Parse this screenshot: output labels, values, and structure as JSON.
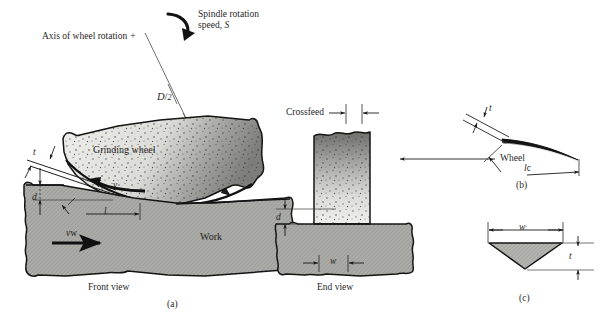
{
  "figure": {
    "title_visible": false,
    "background_color": "#ffffff",
    "ink_color": "#1a1a1a"
  },
  "panel_a": {
    "caption": "(a)",
    "view_label": "Front view",
    "axis_label": "Axis of wheel rotation",
    "axis_marker": "+",
    "spindle_label_line1": "Spindle rotation",
    "spindle_label_line2": "speed, S",
    "spindle_speed_symbol": "S",
    "radius_label_numerator": "D",
    "radius_label_denominator": "2",
    "radius_label": "D/2",
    "wheel_label": "Grinding wheel",
    "work_label": "Work",
    "chip_thickness_label": "t",
    "depth_label": "d",
    "contact_length_label": "l",
    "wheel_speed_label": "v",
    "work_speed_label": "v",
    "work_speed_subscript": "w",
    "wheel_fill_light": "#e8e8e4",
    "wheel_fill_dark": "#8e8e8a",
    "work_fill": "#a9a9a5"
  },
  "panel_b": {
    "caption": "(b)",
    "view_label": "End view",
    "crossfeed_label": "Crossfeed",
    "wheel_label": "Wheel",
    "depth_label": "d",
    "width_label": "w",
    "wheel_fill_top": "#6e6e6a",
    "wheel_fill_bottom": "#ededea",
    "work_fill": "#a9a9a5"
  },
  "panel_c": {
    "caption": "(b)",
    "chip_thickness_label": "t",
    "chip_length_label": "l",
    "chip_length_subscript": "c",
    "chip_color": "#1a1a1a"
  },
  "panel_d": {
    "caption": "(c)",
    "width_label": "w",
    "width_prime": "′",
    "thickness_label": "t",
    "chip_fill": "#b3b3af"
  }
}
